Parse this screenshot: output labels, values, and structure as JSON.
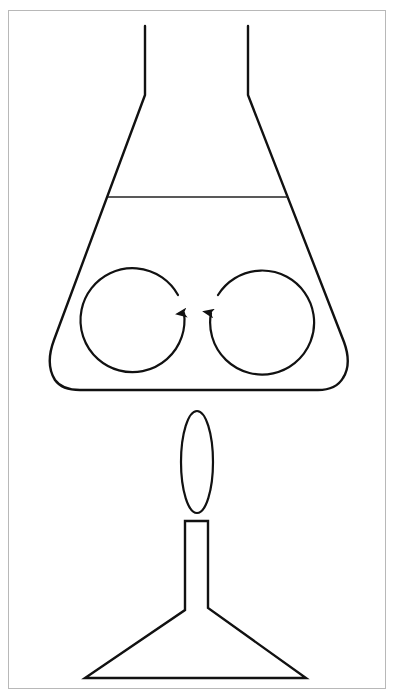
{
  "diagram": {
    "title": "",
    "colors": {
      "background": "#ffffff",
      "stroke": "#111111",
      "frame": "#b8b8b8"
    },
    "elements": [
      {
        "id": "frame",
        "type": "rectangle"
      },
      {
        "id": "conical-flask",
        "type": "flask"
      },
      {
        "id": "liquid-surface",
        "type": "line"
      },
      {
        "id": "convection-loop-left",
        "type": "circular-arrow",
        "direction": "upward at center"
      },
      {
        "id": "convection-loop-right",
        "type": "circular-arrow",
        "direction": "upward at center"
      },
      {
        "id": "flame",
        "type": "ellipse"
      },
      {
        "id": "bunsen-burner",
        "type": "burner"
      }
    ]
  }
}
